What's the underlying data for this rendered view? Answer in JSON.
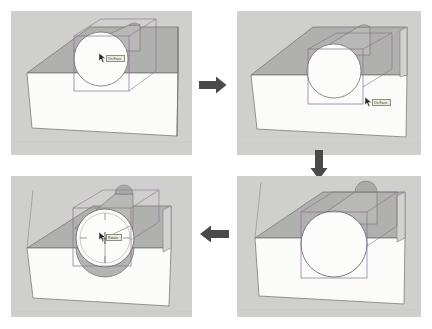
{
  "figure": {
    "title": "Cylinder rotation sequence in 3D modeling viewport",
    "panel_count": 4,
    "flow": "clockwise",
    "background_color": "#ffffff",
    "panel_background": "#c9c9c7",
    "arrow_color": "#4a4a4a"
  },
  "palette": {
    "sky": "#c9c9c7",
    "ground_top_light": "#f2f2f0",
    "box_top": "#b4b4b2",
    "box_front": "#fbfbfa",
    "box_side": "#d2d2d0",
    "cylinder_face": "#fcfcfb",
    "cylinder_body": "#b0b0ae",
    "edge": "#6e6e6c",
    "selection_box": "#8a6f8f",
    "tooltip_bg": "#eceade",
    "tooltip_border": "#8f8d82",
    "cursor_dark": "#2b2b2b",
    "gizmo_line": "#707070"
  },
  "panels": [
    {
      "id": "panel-1",
      "position": "top-left",
      "step": 1,
      "caption": "Cylinder selected on box, cursor over top face",
      "scene": {
        "objects": [
          "box",
          "cylinder",
          "selection-bounding-box"
        ],
        "cylinder_orientation": "horizontal",
        "gizmo": "none"
      },
      "cursor": {
        "visible": true,
        "x": 99,
        "y": 53,
        "tooltip": "On Face"
      }
    },
    {
      "id": "panel-2",
      "position": "top-right",
      "step": 2,
      "caption": "Cursor moved down to box front face",
      "scene": {
        "objects": [
          "box",
          "cylinder",
          "selection-bounding-box"
        ],
        "cylinder_orientation": "horizontal",
        "gizmo": "none"
      },
      "cursor": {
        "visible": true,
        "x": 370,
        "y": 100,
        "tooltip": "On Face"
      }
    },
    {
      "id": "panel-3",
      "position": "bottom-right",
      "step": 3,
      "caption": "View rotated, cylinder aligned front-on",
      "scene": {
        "objects": [
          "box",
          "cylinder",
          "selection-bounding-box"
        ],
        "cylinder_orientation": "front-facing",
        "gizmo": "none"
      },
      "cursor": {
        "visible": false,
        "x": 0,
        "y": 0,
        "tooltip": ""
      }
    },
    {
      "id": "panel-4",
      "position": "bottom-left",
      "step": 4,
      "caption": "Rotate protractor gizmo placed on cylinder face",
      "scene": {
        "objects": [
          "box",
          "cylinder",
          "selection-bounding-box",
          "rotate-protractor"
        ],
        "cylinder_orientation": "front-facing",
        "gizmo": "rotate-protractor"
      },
      "cursor": {
        "visible": true,
        "x": 72,
        "y": 212,
        "tooltip": "Rotate"
      }
    }
  ],
  "arrows": [
    {
      "id": "arrow-1",
      "direction": "right",
      "from": "panel-1",
      "to": "panel-2",
      "label": "step 1 to 2"
    },
    {
      "id": "arrow-2",
      "direction": "down",
      "from": "panel-2",
      "to": "panel-3",
      "label": "step 2 to 3"
    },
    {
      "id": "arrow-3",
      "direction": "left",
      "from": "panel-3",
      "to": "panel-4",
      "label": "step 3 to 4"
    }
  ]
}
